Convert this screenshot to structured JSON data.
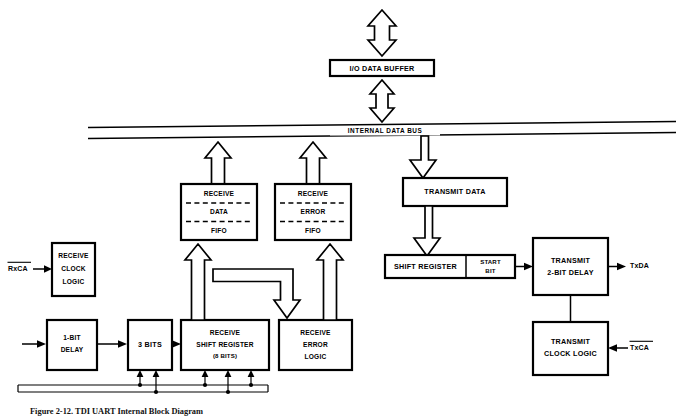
{
  "figure": {
    "caption": "Figure  2-12.   TDI UART Internal Block Diagram",
    "title": "UART Internal Block Diagram"
  },
  "bus": {
    "label": "INTERNAL DATA BUS"
  },
  "blocks": {
    "io_data_buffer": {
      "label": "I/O DATA BUFFER"
    },
    "receive_clock_logic": {
      "line1": "RECEIVE",
      "line2": "CLOCK",
      "line3": "LOGIC"
    },
    "receive_data_fifo": {
      "line1": "RECEIVE",
      "line2": "DATA",
      "line3": "FIFO"
    },
    "receive_error_fifo": {
      "line1": "RECEIVE",
      "line2": "ERROR",
      "line3": "FIFO"
    },
    "transmit_data": {
      "label": "TRANSMIT DATA"
    },
    "shift_register": {
      "label": "SHIFT REGISTER"
    },
    "start_bit": {
      "line1": "START",
      "line2": "BIT"
    },
    "transmit_2bit_delay": {
      "line1": "TRANSMIT",
      "line2": "2-BIT DELAY"
    },
    "transmit_clock_logic": {
      "line1": "TRANSMIT",
      "line2": "CLOCK LOGIC"
    },
    "one_bit_delay": {
      "line1": "1-BIT",
      "line2": "DELAY"
    },
    "three_bits": {
      "label": "3 BITS"
    },
    "receive_shift_register": {
      "line1": "RECEIVE",
      "line2": "SHIFT REGISTER",
      "line3": "(8 BITS)"
    },
    "receive_error_logic": {
      "line1": "RECEIVE",
      "line2": "ERROR",
      "line3": "LOGIC"
    }
  },
  "pins": {
    "rxca": {
      "label": "RxCA",
      "complement": true
    },
    "txca": {
      "label": "TxCA",
      "complement": true
    },
    "txda": {
      "label": "TxDA",
      "complement": false
    }
  },
  "colors": {
    "ink": "#000000",
    "paper": "#ffffff"
  }
}
